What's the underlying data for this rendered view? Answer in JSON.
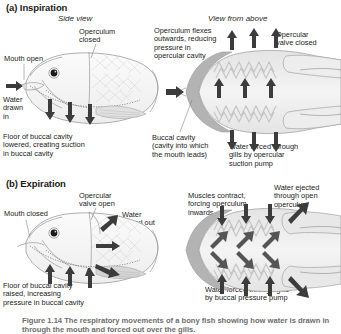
{
  "figure": {
    "caption": "Figure 1.14 The respiratory movements of a bony fish showing how water is drawn in through the mouth and forced out over the gills."
  },
  "sections": [
    {
      "id": "a",
      "heading": "(a) Inspiration",
      "views": [
        {
          "id": "side",
          "label": "Side view"
        },
        {
          "id": "above",
          "label": "View from above"
        }
      ],
      "labels": {
        "mouth": "Mouth open",
        "operculum": "Operculum\nclosed",
        "water_flow": "Water\ndrawn\nin",
        "floor": "Floor of buccal cavity\nlowered, creating suction\nin buccal cavity",
        "operculum_flex": "Operculum flexes\noutwards, reducing\npressure in\nopercular cavity",
        "opercular_valve": "Opercular\nvalve closed",
        "buccal_cavity": "Buccal cavity\n(cavity into which\nthe mouth leads)",
        "pump": "Water forced through\ngills by opercular\nsuction pump"
      }
    },
    {
      "id": "b",
      "heading": "(b) Expiration",
      "labels": {
        "mouth": "Mouth closed",
        "opercular_valve": "Opercular\nvalve open",
        "water_out": "Water\nforced out",
        "floor": "Floor of buccal cavity\nraised, increasing\npressure in buccal cavity",
        "muscles": "Muscles contract,\nforcing operculum\ninwards",
        "water_ejected": "Water ejected\nthrough open\noperculum",
        "pump": "Water forced through gills\nby buccal pressure pump"
      }
    }
  ],
  "colors": {
    "body_fill": "#f2f2f2",
    "body_edge": "#9a9a9a",
    "arrow": "#3c3c3c",
    "operculum_band": "#b0b0b0",
    "eye": "#1a1a1a",
    "caption": "#6d6d6d"
  }
}
